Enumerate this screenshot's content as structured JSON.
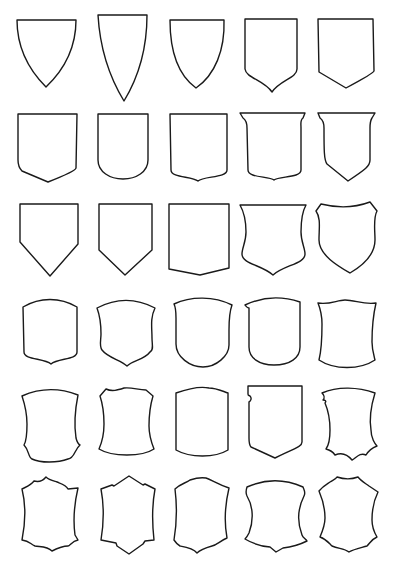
{
  "title": "Heraldic shield outline collection",
  "layout": {
    "rows": 6,
    "columns": 5,
    "background": "#ffffff",
    "stroke_color": "#1a1a1a"
  },
  "rows": [
    {
      "label": "row-1",
      "shields": [
        "pointed-heater",
        "tall-pointed-heater",
        "round-heater",
        "ogee-point",
        "chamfer-point"
      ]
    },
    {
      "label": "row-2",
      "shields": [
        "chamfer-point-square",
        "round-bottom",
        "notched-round",
        "flared-top-notched",
        "flared-top-chamfer"
      ]
    },
    {
      "label": "row-3",
      "shields": [
        "pentagon-point",
        "pentagon-point-narrow",
        "flat-bottom-slant",
        "waisted-notched",
        "peaked-top-round"
      ]
    },
    {
      "label": "row-4",
      "shields": [
        "arched-notched",
        "waisted-arched-notched",
        "arched-round",
        "arched-round-square",
        "wavy-top-concave"
      ]
    },
    {
      "label": "row-5",
      "shields": [
        "concave-notched-corners",
        "wavy-concave",
        "arched-concave",
        "nicked-chamfer",
        "torn-scalloped"
      ]
    },
    {
      "label": "row-6",
      "shields": [
        "scalloped-star",
        "cut-corner-diamond",
        "scalloped-arched",
        "bulged-cartouche",
        "scalloped-cartouche"
      ]
    }
  ]
}
